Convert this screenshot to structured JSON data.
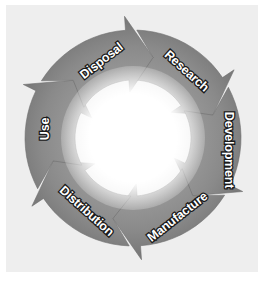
{
  "diagram": {
    "type": "cycle",
    "title": "",
    "stages": [
      {
        "label": "Research"
      },
      {
        "label": "Development"
      },
      {
        "label": "Manufacture"
      },
      {
        "label": "Distribution"
      },
      {
        "label": "Use"
      },
      {
        "label": "Disposal"
      }
    ],
    "colors": {
      "arrow": "#8a8a8a",
      "arrow_dark": "#6e6e6e",
      "background": "#eeeeee",
      "center": "#ffffff",
      "label_fill": "#ffffff",
      "label_stroke": "#1a1a1a"
    }
  }
}
